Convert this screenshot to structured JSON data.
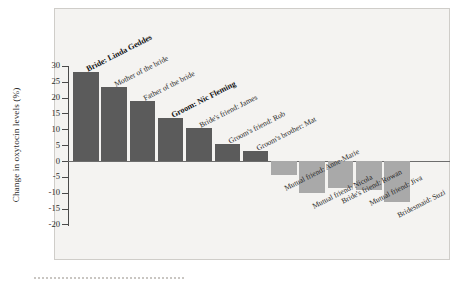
{
  "chart_data": {
    "type": "bar",
    "title": "",
    "xlabel": "",
    "ylabel": "Change in oxytocin levels (%)",
    "ylim": [
      -20,
      30
    ],
    "ytick_labels": [
      "30",
      "25",
      "20",
      "15",
      "10",
      "5",
      "0",
      "-5",
      "-10",
      "-15",
      "-20"
    ],
    "ytick_values": [
      30,
      25,
      20,
      15,
      10,
      5,
      0,
      -5,
      -10,
      -15,
      -20
    ],
    "grid": false,
    "legend": "none",
    "colors": {
      "positive_bar": "#5b5b5b",
      "negative_bar": "#a9a9a9",
      "plot_background": "#f4f3f1",
      "axis": "#4a4a4a",
      "text": "#262626"
    },
    "categories": [
      "Bride: Linda Geddes",
      "Mother of the bride",
      "Father of the bride",
      "Groom: Nic Fleming",
      "Bride's friend: James",
      "Groom's friend: Rob",
      "Groom's brother: Mat",
      "Mutual friend: Anne-Marie",
      "Mutual friend: Nicola",
      "Bride's friend: Rowan",
      "Mutual friend: Jiva",
      "Bridesmaid: Suzi"
    ],
    "values": [
      28,
      23.5,
      19,
      13.5,
      10.5,
      5.5,
      3,
      -4.5,
      -10,
      -8.5,
      -9,
      -13
    ],
    "emphasis": [
      true,
      false,
      false,
      true,
      false,
      false,
      false,
      false,
      false,
      false,
      false,
      false
    ]
  }
}
